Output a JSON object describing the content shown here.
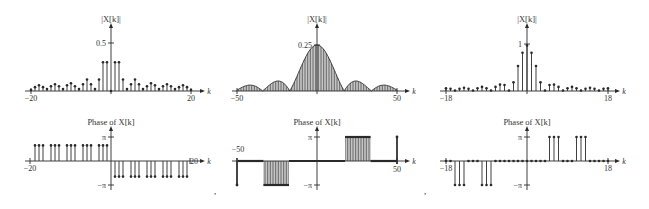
{
  "separators": [
    ",",
    ","
  ],
  "chart_data": [
    {
      "type": "stem",
      "title": "|X[k]|",
      "xlabel": "k",
      "xlim": [
        -20,
        20
      ],
      "x_ticks": [
        "-20",
        "20"
      ],
      "y_ticks": [
        "0.5"
      ],
      "ylim": [
        0,
        0.5
      ],
      "k": [
        -20,
        -19,
        -18,
        -17,
        -16,
        -15,
        -14,
        -13,
        -12,
        -11,
        -10,
        -9,
        -8,
        -7,
        -6,
        -5,
        -4,
        -3,
        -2,
        -1,
        0,
        1,
        2,
        3,
        4,
        5,
        6,
        7,
        8,
        9,
        10,
        11,
        12,
        13,
        14,
        15,
        16,
        17,
        18,
        19,
        20
      ],
      "values": [
        0.01,
        0.04,
        0.06,
        0.04,
        0.02,
        0.05,
        0.07,
        0.05,
        0.02,
        0.06,
        0.08,
        0.05,
        0.02,
        0.07,
        0.12,
        0.07,
        0.02,
        0.12,
        0.3,
        0.3,
        0.0,
        0.3,
        0.3,
        0.12,
        0.02,
        0.07,
        0.12,
        0.07,
        0.02,
        0.05,
        0.08,
        0.06,
        0.02,
        0.05,
        0.07,
        0.05,
        0.02,
        0.04,
        0.06,
        0.04,
        0.01
      ]
    },
    {
      "type": "stem",
      "title": "Phase of X[k]",
      "xlabel": "k",
      "xlim": [
        -20,
        20
      ],
      "x_ticks": [
        "-20",
        "20"
      ],
      "y_ticks": [
        "π",
        "−π"
      ],
      "ylim": [
        -3.1416,
        3.1416
      ],
      "description": "Groups of 3 stems at +π/2-ish height for k<0 (separated by gaps), groups of 3 at negative height for k>0",
      "k": [
        -19,
        -18,
        -17,
        -15,
        -14,
        -13,
        -11,
        -10,
        -9,
        -7,
        -6,
        -5,
        -3,
        -2,
        -1,
        1,
        2,
        3,
        5,
        6,
        7,
        9,
        10,
        11,
        13,
        14,
        15,
        17,
        18,
        19
      ],
      "values": [
        1.57,
        1.57,
        1.57,
        1.57,
        1.57,
        1.57,
        1.57,
        1.57,
        1.57,
        1.57,
        1.57,
        1.57,
        1.57,
        1.57,
        1.57,
        -1.57,
        -1.57,
        -1.57,
        -1.57,
        -1.57,
        -1.57,
        -1.57,
        -1.57,
        -1.57,
        -1.57,
        -1.57,
        -1.57,
        -1.57,
        -1.57,
        -1.57
      ]
    },
    {
      "type": "stem",
      "title": "|X[k]|",
      "xlabel": "k",
      "xlim": [
        -50,
        50
      ],
      "x_ticks": [
        "-50",
        "50"
      ],
      "y_ticks": [
        "0.25"
      ],
      "ylim": [
        0,
        0.25
      ],
      "description": "Dense stems following |sinc|-shaped envelope: main lobe peak 0.25 at k=0, zeros near k=±17, ±33, side lobes ~0.055 near k=±25 and ~0.04 near k=±41"
    },
    {
      "type": "stem",
      "title": "Phase of X[k]",
      "xlabel": "k",
      "xlim": [
        -50,
        50
      ],
      "x_ticks": [
        "-50",
        "50"
      ],
      "y_ticks": [
        "π",
        "−π"
      ],
      "ylim": [
        -3.1416,
        3.1416
      ],
      "description": "k=-50: −π; k=-49..-34: 0; k=-33..-18: −π; k=-17..17: 0; k=18..33: +π; k=34..49: 0; k=50: +π"
    },
    {
      "type": "stem",
      "title": "|X[k]|",
      "xlabel": "k",
      "xlim": [
        -18,
        18
      ],
      "x_ticks": [
        "-18",
        "18"
      ],
      "y_ticks": [
        "1"
      ],
      "ylim": [
        0,
        1
      ],
      "k": [
        -18,
        -17,
        -16,
        -15,
        -14,
        -13,
        -12,
        -11,
        -10,
        -9,
        -8,
        -7,
        -6,
        -5,
        -4,
        -3,
        -2,
        -1,
        0,
        1,
        2,
        3,
        4,
        5,
        6,
        7,
        8,
        9,
        10,
        11,
        12,
        13,
        14,
        15,
        16,
        17,
        18
      ],
      "values": [
        0.06,
        0.05,
        0.01,
        0.05,
        0.07,
        0.05,
        0.01,
        0.06,
        0.09,
        0.06,
        0.01,
        0.09,
        0.14,
        0.13,
        0.01,
        0.19,
        0.55,
        0.84,
        1.0,
        0.84,
        0.55,
        0.19,
        0.01,
        0.13,
        0.14,
        0.09,
        0.01,
        0.06,
        0.09,
        0.06,
        0.01,
        0.05,
        0.07,
        0.05,
        0.01,
        0.05,
        0.06
      ]
    },
    {
      "type": "stem",
      "title": "Phase of X[k]",
      "xlabel": "k",
      "xlim": [
        -18,
        18
      ],
      "x_ticks": [
        "-18",
        "18"
      ],
      "y_ticks": [
        "π",
        "−π"
      ],
      "ylim": [
        -3.1416,
        3.1416
      ],
      "k": [
        -18,
        -17,
        -16,
        -15,
        -14,
        -13,
        -12,
        -11,
        -10,
        -9,
        -8,
        -7,
        -6,
        -5,
        -4,
        -3,
        -2,
        -1,
        0,
        1,
        2,
        3,
        4,
        5,
        6,
        7,
        8,
        9,
        10,
        11,
        12,
        13,
        14,
        15,
        16,
        17,
        18
      ],
      "values": [
        0,
        0,
        -3.1416,
        -3.1416,
        -3.1416,
        0,
        0,
        0,
        -3.1416,
        -3.1416,
        -3.1416,
        0,
        0,
        0,
        0,
        0,
        0,
        0,
        0,
        0,
        0,
        0,
        0,
        3.1416,
        3.1416,
        3.1416,
        0,
        0,
        0,
        3.1416,
        3.1416,
        3.1416,
        0,
        0,
        0,
        0,
        0
      ]
    }
  ]
}
